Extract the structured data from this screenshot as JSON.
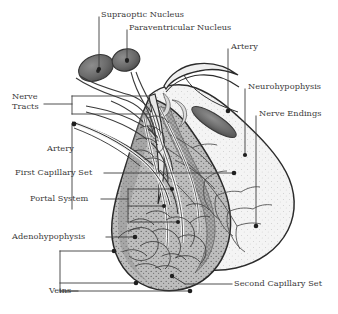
{
  "figure": {
    "background_color": "#ffffff",
    "ink_color": "#2b2b2b",
    "label_text_color": "#3a3a3a",
    "anterior_lobe_fill": "#9a9a9a",
    "posterior_lobe_fill": "#f2f2f2",
    "nucleus_fill": "#6e6e6e"
  },
  "labels": {
    "supraoptic_nucleus": "Supraoptic Nucleus",
    "paraventricular_nucleus": "Paraventricular Nucleus",
    "artery_top": "Artery",
    "neurohypophysis": "Neurohypophysis",
    "nerve_endings": "Nerve Endings",
    "nerve_tracts_line1": "Nerve",
    "nerve_tracts_line2": "Tracts",
    "artery_left": "Artery",
    "first_capillary_set": "First Capillary Set",
    "portal_system": "Portal System",
    "adenohypophysis": "Adenohypophysis",
    "veins": "Veins",
    "second_capillary_set": "Second Capillary Set"
  },
  "structures": [
    {
      "name": "supraoptic-nucleus",
      "kind": "oval-nucleus"
    },
    {
      "name": "paraventricular-nucleus",
      "kind": "oval-nucleus"
    },
    {
      "name": "infundibular-stalk",
      "kind": "stalk"
    },
    {
      "name": "adenohypophysis-anterior-lobe",
      "kind": "lobe"
    },
    {
      "name": "neurohypophysis-posterior-lobe",
      "kind": "lobe"
    },
    {
      "name": "hypophyseal-portal-vessels",
      "kind": "vessel-network"
    },
    {
      "name": "primary-capillary-plexus",
      "kind": "vessel-network"
    },
    {
      "name": "secondary-capillary-plexus",
      "kind": "vessel-network"
    },
    {
      "name": "nerve-fiber-tree",
      "kind": "nerve-network"
    }
  ]
}
